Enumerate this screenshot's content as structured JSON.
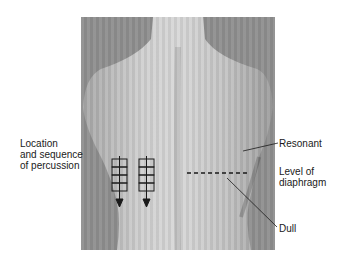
{
  "figure": {
    "labels": {
      "percussion": "Location\nand sequence\nof percussion",
      "resonant": "Resonant",
      "diaphragm": "Level of\ndiaphragm",
      "dull": "Dull"
    },
    "percussion_grids": [
      {
        "side": "left",
        "rows": 4
      },
      {
        "side": "right",
        "rows": 4
      }
    ],
    "colors": {
      "background": "#ffffff",
      "photo_gray": "#8f8f8f",
      "skin": "#c8c8c8",
      "ink": "#1a1a1a"
    }
  }
}
